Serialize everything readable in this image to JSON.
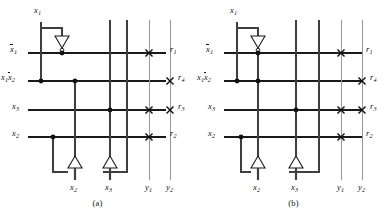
{
  "figure": {
    "title_visible": false,
    "background_color": "#ffffff",
    "panels": [
      {
        "id": "a",
        "caption": "(a)",
        "top_input_label": "x",
        "top_input_sub": "1",
        "row_labels": [
          {
            "name": "x1-bar-row",
            "base": "x",
            "sub": "1",
            "overline": true,
            "prefix": ""
          },
          {
            "name": "x1-x2bar-row",
            "base": "x",
            "sub": "2",
            "overline": true,
            "prefix": "x",
            "prefix_sub": "1"
          },
          {
            "name": "x3-row",
            "base": "x",
            "sub": "3",
            "overline": false,
            "prefix": ""
          },
          {
            "name": "x2-row",
            "base": "x",
            "sub": "2",
            "overline": false,
            "prefix": ""
          }
        ],
        "right_labels": [
          {
            "base": "r",
            "sub": "1"
          },
          {
            "base": "r",
            "sub": "4"
          },
          {
            "base": "r",
            "sub": "3"
          },
          {
            "base": "r",
            "sub": "2"
          }
        ],
        "bottom_labels": [
          {
            "base": "x",
            "sub": "2"
          },
          {
            "base": "x",
            "sub": "3"
          },
          {
            "base": "y",
            "sub": "1"
          },
          {
            "base": "y",
            "sub": "2"
          }
        ],
        "crosspoints": [
          {
            "row": "r1",
            "col": "y1"
          },
          {
            "row": "r4",
            "col": "y2"
          },
          {
            "row": "r3",
            "col": "y1"
          },
          {
            "row": "r3",
            "col": "y2"
          },
          {
            "row": "r2",
            "col": "y1"
          }
        ],
        "junction_dots": [
          {
            "row": "r1",
            "col": "inv1-out"
          },
          {
            "row": "r4",
            "col": "x1-bus"
          },
          {
            "row": "r4",
            "col": "x2-bus"
          },
          {
            "row": "r3",
            "col": "x3-bus"
          },
          {
            "row": "r2",
            "col": "x2-tap"
          }
        ],
        "inverters": [
          {
            "name": "inverter-x1",
            "direction": "down"
          },
          {
            "name": "inverter-x2",
            "direction": "up"
          },
          {
            "name": "inverter-x3",
            "direction": "up"
          }
        ]
      },
      {
        "id": "b",
        "caption": "(b)",
        "top_input_label": "x",
        "top_input_sub": "1",
        "row_labels": [
          {
            "name": "x1-bar-row",
            "base": "x",
            "sub": "1",
            "overline": true,
            "prefix": ""
          },
          {
            "name": "x1-x2bar-row",
            "base": "x",
            "sub": "2",
            "overline": true,
            "prefix": "x",
            "prefix_sub": "1"
          },
          {
            "name": "x3-row",
            "base": "x",
            "sub": "3",
            "overline": false,
            "prefix": ""
          },
          {
            "name": "x2-row",
            "base": "x",
            "sub": "2",
            "overline": false,
            "prefix": ""
          }
        ],
        "right_labels": [
          {
            "base": "r",
            "sub": "1"
          },
          {
            "base": "r",
            "sub": "4"
          },
          {
            "base": "r",
            "sub": "3"
          },
          {
            "base": "r",
            "sub": "2"
          }
        ],
        "bottom_labels": [
          {
            "base": "x",
            "sub": "2"
          },
          {
            "base": "x",
            "sub": "3"
          },
          {
            "base": "y",
            "sub": "1"
          },
          {
            "base": "y",
            "sub": "2"
          }
        ],
        "crosspoints": [
          {
            "row": "r1",
            "col": "y1"
          },
          {
            "row": "r4",
            "col": "y2"
          },
          {
            "row": "r3",
            "col": "y1"
          },
          {
            "row": "r3",
            "col": "y2"
          },
          {
            "row": "r2",
            "col": "y1"
          }
        ],
        "junction_dots": [
          {
            "row": "r1",
            "col": "inv1-out"
          },
          {
            "row": "r4",
            "col": "x1-bus"
          },
          {
            "row": "r4",
            "col": "x2-bus"
          },
          {
            "row": "r3",
            "col": "x3-bus"
          },
          {
            "row": "r2",
            "col": "x2-tap"
          }
        ],
        "inverters": [
          {
            "name": "inverter-x1",
            "direction": "down"
          },
          {
            "name": "inverter-x2",
            "direction": "up"
          },
          {
            "name": "inverter-x3",
            "direction": "up"
          }
        ]
      }
    ],
    "colors": {
      "wire_dark": "#1a1a1a",
      "wire_bus": "#3a3a3a",
      "wire_light": "#9a9a9a",
      "text": "#111111",
      "background": "#ffffff"
    }
  },
  "panel_a": {
    "caption": "(a)",
    "top_x1": "x",
    "top_x1_sub": "1",
    "row1_base": "x",
    "row1_sub": "1",
    "row2_prefix": "x",
    "row2_prefix_sub": "1",
    "row2_base": "x",
    "row2_sub": "2",
    "row3_base": "x",
    "row3_sub": "3",
    "row4_base": "x",
    "row4_sub": "2",
    "r1": "r",
    "r1_sub": "1",
    "r4": "r",
    "r4_sub": "4",
    "r3": "r",
    "r3_sub": "3",
    "r2": "r",
    "r2_sub": "2",
    "b1": "x",
    "b1_sub": "2",
    "b2": "x",
    "b2_sub": "3",
    "b3": "y",
    "b3_sub": "1",
    "b4": "y",
    "b4_sub": "2"
  },
  "panel_b": {
    "caption": "(b)",
    "top_x1": "x",
    "top_x1_sub": "1",
    "row1_base": "x",
    "row1_sub": "1",
    "row2_prefix": "x",
    "row2_prefix_sub": "1",
    "row2_base": "x",
    "row2_sub": "2",
    "row3_base": "x",
    "row3_sub": "3",
    "row4_base": "x",
    "row4_sub": "2",
    "r1": "r",
    "r1_sub": "1",
    "r4": "r",
    "r4_sub": "4",
    "r3": "r",
    "r3_sub": "3",
    "r2": "r",
    "r2_sub": "2",
    "b1": "x",
    "b1_sub": "2",
    "b2": "x",
    "b2_sub": "3",
    "b3": "y",
    "b3_sub": "1",
    "b4": "y",
    "b4_sub": "2"
  }
}
